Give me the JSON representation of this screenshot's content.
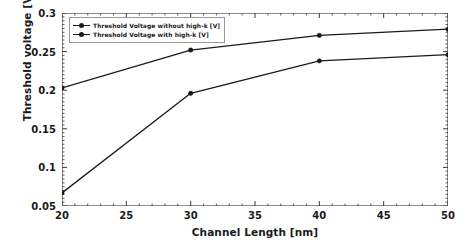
{
  "chart_data": {
    "type": "line",
    "title": "",
    "xlabel": "Channel Length [nm]",
    "ylabel": "Threshold voltage [V]",
    "xlim": [
      20,
      50
    ],
    "ylim": [
      0.05,
      0.3
    ],
    "xticks": [
      20,
      25,
      30,
      35,
      40,
      45,
      50
    ],
    "xticklabels": [
      "20",
      "25",
      "30",
      "35",
      "40",
      "45",
      "50"
    ],
    "yticks": [
      0.05,
      0.1,
      0.15,
      0.2,
      0.25,
      0.3
    ],
    "yticklabels": [
      "0.05",
      "0.1",
      "0.15",
      "0.2",
      "0.25",
      "0.3"
    ],
    "minor_ticks": true,
    "grid": false,
    "legend_position": "upper left",
    "x": [
      20,
      30,
      40,
      50
    ],
    "series": [
      {
        "name": "Threshold Voltage without high-k [V]",
        "values": [
          0.203,
          0.252,
          0.271,
          0.279
        ],
        "color": "#1a1a1a",
        "marker": "circle"
      },
      {
        "name": "Threshold Voltage with high-k [V]",
        "values": [
          0.067,
          0.196,
          0.238,
          0.246
        ],
        "color": "#1a1a1a",
        "marker": "circle"
      }
    ]
  },
  "legend": {
    "entries": [
      "Threshold Voltage without high-k [V]",
      "Threshold Voltage with high-k [V]"
    ]
  },
  "axes": {
    "xlabel": "Channel Length [nm]",
    "ylabel": "Threshold voltage [V]"
  }
}
